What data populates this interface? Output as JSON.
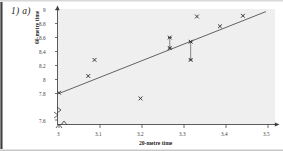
{
  "figure": {
    "question_label": "1) a)"
  },
  "chart_data": {
    "type": "scatter",
    "title": "",
    "xlabel": "20-metre time",
    "ylabel": "60-metre time",
    "xlim": [
      2.995,
      3.52
    ],
    "ylim": [
      7.55,
      9.02
    ],
    "xticks": [
      "3",
      "3.1",
      "3.2",
      "3.3",
      "3.4",
      "3.5"
    ],
    "xtickvals": [
      3,
      3.1,
      3.2,
      3.3,
      3.4,
      3.5
    ],
    "yticks": [
      "7.6",
      "7.8",
      "8",
      "8.2",
      "8.4",
      "8.6",
      "8.8",
      "9"
    ],
    "ytickvals": [
      7.6,
      7.8,
      8.0,
      8.2,
      8.4,
      8.6,
      8.8,
      9.0
    ],
    "grid": false,
    "legend": "none",
    "axis_break": true,
    "marker": "x",
    "points": [
      {
        "x": 3.0,
        "y": 7.81
      },
      {
        "x": 3.085,
        "y": 8.28
      },
      {
        "x": 3.07,
        "y": 8.05
      },
      {
        "x": 3.195,
        "y": 7.73
      },
      {
        "x": 3.265,
        "y": 8.6
      },
      {
        "x": 3.265,
        "y": 8.45
      },
      {
        "x": 3.315,
        "y": 8.54
      },
      {
        "x": 3.315,
        "y": 8.28
      },
      {
        "x": 3.33,
        "y": 8.9
      },
      {
        "x": 3.385,
        "y": 8.76
      },
      {
        "x": 3.44,
        "y": 8.91
      }
    ],
    "regression_line": {
      "label": "Regression line",
      "x1": 3.0,
      "y1": 7.8,
      "x2": 3.495,
      "y2": 8.97
    },
    "annotations": [
      {
        "text": "Residual for d) (ii)",
        "x": 3.265,
        "y_top": 8.6,
        "y_bottom": 8.45
      },
      {
        "text": "Residual for d) (i)",
        "x": 3.315,
        "y_top": 8.54,
        "y_bottom": 8.28
      }
    ]
  }
}
